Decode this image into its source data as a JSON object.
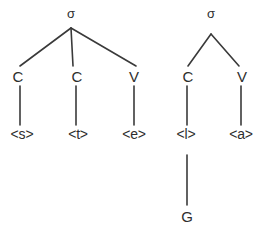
{
  "diagram": {
    "background_color": "#ffffff",
    "line_color": "#3a3a3a",
    "text_color": "#2e2e2e",
    "trees": [
      {
        "id": "left-tree",
        "root": {
          "label": "σ",
          "x": 71,
          "y": 13
        },
        "branches": [
          {
            "from": [
              71,
              28
            ],
            "to": [
              20,
              66
            ]
          },
          {
            "from": [
              71,
              28
            ],
            "to": [
              73,
              66
            ]
          },
          {
            "from": [
              71,
              28
            ],
            "to": [
              136,
              66
            ]
          }
        ],
        "nodes": [
          {
            "label": "C",
            "x": 18,
            "y": 76
          },
          {
            "label": "C",
            "x": 77,
            "y": 76
          },
          {
            "label": "V",
            "x": 134,
            "y": 76
          }
        ],
        "stems": [
          {
            "from": [
              20,
              86
            ],
            "to": [
              20,
              125
            ]
          },
          {
            "from": [
              76,
              86
            ],
            "to": [
              76,
              125
            ]
          },
          {
            "from": [
              134,
              86
            ],
            "to": [
              134,
              125
            ]
          }
        ],
        "terminals": [
          {
            "label": "<s>",
            "x": 22,
            "y": 134
          },
          {
            "label": "<t>",
            "x": 78,
            "y": 134
          },
          {
            "label": "<e>",
            "x": 134,
            "y": 134
          }
        ],
        "sub_stems": [],
        "sub_nodes": []
      },
      {
        "id": "right-tree",
        "root": {
          "label": "σ",
          "x": 211,
          "y": 13
        },
        "branches": [
          {
            "from": [
              211,
              34
            ],
            "to": [
              188,
              66
            ]
          },
          {
            "from": [
              211,
              34
            ],
            "to": [
              239,
              66
            ]
          }
        ],
        "nodes": [
          {
            "label": "C",
            "x": 188,
            "y": 76
          },
          {
            "label": "V",
            "x": 242,
            "y": 76
          }
        ],
        "stems": [
          {
            "from": [
              187,
              86
            ],
            "to": [
              187,
              125
            ]
          },
          {
            "from": [
              241,
              86
            ],
            "to": [
              241,
              125
            ]
          }
        ],
        "terminals": [
          {
            "label": "<l>",
            "x": 186,
            "y": 134
          },
          {
            "label": "<a>",
            "x": 241,
            "y": 134
          }
        ],
        "sub_stems": [
          {
            "from": [
              187,
              155
            ],
            "to": [
              187,
              205
            ]
          }
        ],
        "sub_nodes": [
          {
            "label": "G",
            "x": 187,
            "y": 216
          }
        ]
      }
    ]
  }
}
